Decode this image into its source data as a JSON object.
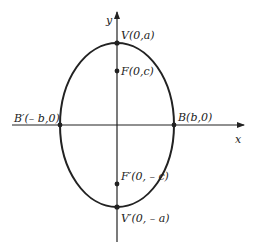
{
  "diagram": {
    "type": "ellipse-vertical-major-axis",
    "axes": {
      "x_label": "x",
      "y_label": "y"
    },
    "points": {
      "vertex_top": "V(0,a)",
      "focus_top": "F(0,c)",
      "covertex_left": "B′(– b,0)",
      "covertex_right": "B(b,0)",
      "focus_bottom": "F′(0, – c)",
      "vertex_bottom": "V′(0, – a)"
    },
    "colors": {
      "stroke": "#222222",
      "background": "#ffffff"
    }
  }
}
